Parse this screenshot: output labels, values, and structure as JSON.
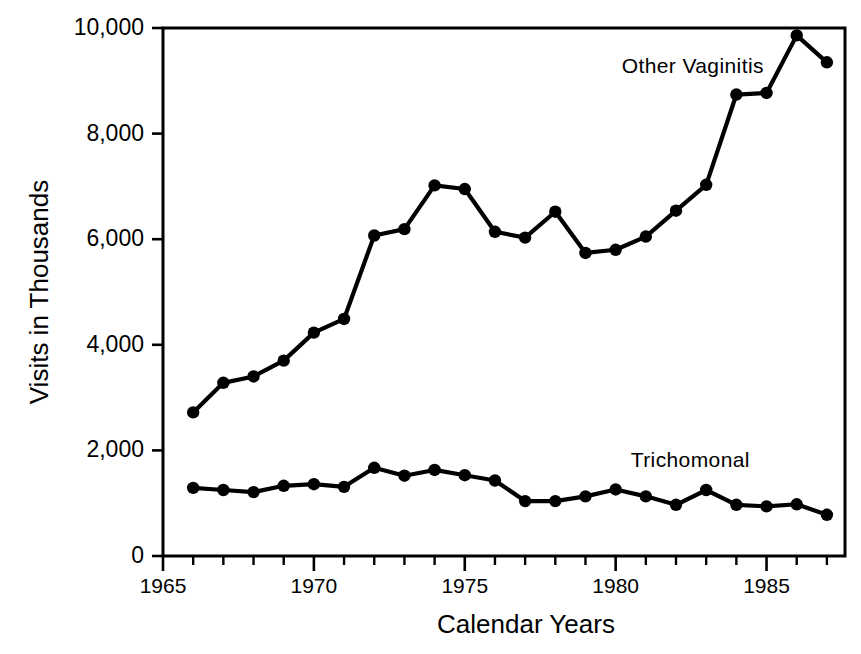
{
  "chart_data": {
    "type": "line",
    "title": "",
    "xlabel": "Calendar Years",
    "ylabel": "Visits in Thousands",
    "xlim": [
      1965,
      1987.6
    ],
    "ylim": [
      0,
      10000
    ],
    "grid": false,
    "legend_position": "inline-annotations",
    "x": [
      1966,
      1967,
      1968,
      1969,
      1970,
      1971,
      1972,
      1973,
      1974,
      1975,
      1976,
      1977,
      1978,
      1979,
      1980,
      1981,
      1982,
      1983,
      1984,
      1985,
      1986,
      1987
    ],
    "series": [
      {
        "name": "Other Vaginitis",
        "label_x": 1980.2,
        "label_y": 9430,
        "values": [
          2720,
          3280,
          3400,
          3700,
          4230,
          4490,
          6070,
          6190,
          7020,
          6950,
          6140,
          6030,
          6520,
          5740,
          5800,
          6050,
          6540,
          7030,
          8740,
          8770,
          9860,
          9350
        ]
      },
      {
        "name": "Trichomonal",
        "label_x": 1980.5,
        "label_y": 1980,
        "values": [
          1290,
          1250,
          1210,
          1330,
          1360,
          1310,
          1670,
          1520,
          1630,
          1530,
          1430,
          1040,
          1040,
          1130,
          1260,
          1130,
          970,
          1250,
          970,
          940,
          980,
          780
        ]
      }
    ],
    "y_ticks": [
      0,
      2000,
      4000,
      6000,
      8000,
      10000
    ],
    "y_tick_labels": [
      "0",
      "2,000",
      "4,000",
      "6,000",
      "8,000",
      "10,000"
    ],
    "x_ticks": [
      1965,
      1966,
      1967,
      1968,
      1969,
      1970,
      1971,
      1972,
      1973,
      1974,
      1975,
      1976,
      1977,
      1978,
      1979,
      1980,
      1981,
      1982,
      1983,
      1984,
      1985,
      1986,
      1987
    ],
    "x_major_ticks": [
      1965,
      1970,
      1975,
      1980,
      1985
    ],
    "x_tick_labels": [
      "1965",
      "1970",
      "1975",
      "1980",
      "1985"
    ],
    "colors": {
      "line": "#000000",
      "marker": "#000000",
      "axis": "#000000",
      "background": "#ffffff",
      "text": "#000000"
    }
  },
  "figure": {
    "width": 861,
    "height": 654,
    "plot_left": 163,
    "plot_right": 845,
    "plot_top": 28,
    "plot_bottom": 556
  }
}
